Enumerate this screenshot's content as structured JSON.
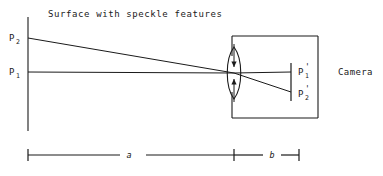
{
  "figure": {
    "type": "optical-imaging-ray-diagram",
    "title": "Surface with speckle features",
    "camera_label": "Camera",
    "object_points": [
      {
        "id": "P2",
        "base": "P",
        "subscript": "2",
        "prime": ""
      },
      {
        "id": "P1",
        "base": "P",
        "subscript": "1",
        "prime": ""
      }
    ],
    "image_points": [
      {
        "id": "P1p",
        "base": "P",
        "subscript": "1",
        "prime": "'"
      },
      {
        "id": "P2p",
        "base": "P",
        "subscript": "2",
        "prime": "'"
      }
    ],
    "dimensions": [
      {
        "id": "a",
        "label": "a"
      },
      {
        "id": "b",
        "label": "b"
      }
    ],
    "elements": {
      "object_plane": "surface-line",
      "lens": "biconvex-converging-lens",
      "image_plane": "sensor-line",
      "camera_body": "camera-box"
    },
    "colors": {
      "ink": "#1a1a1a",
      "background": "#ffffff"
    }
  }
}
